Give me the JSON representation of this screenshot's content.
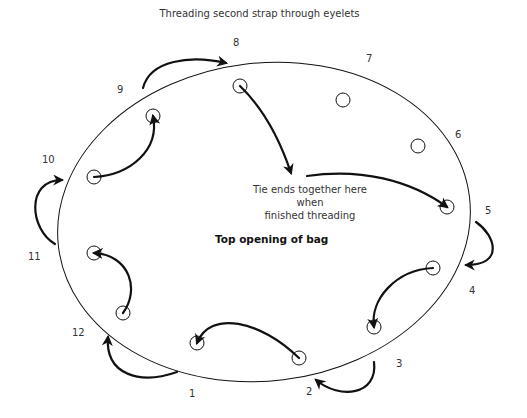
{
  "title": "Threading second strap through eyelets",
  "center_label": "Top opening of bag",
  "note": {
    "line1": "Tie ends together here when",
    "line2": "finished threading"
  },
  "eyelet_numbers": [
    {
      "n": "1",
      "x": 189,
      "y": 389
    },
    {
      "n": "2",
      "x": 306,
      "y": 387
    },
    {
      "n": "3",
      "x": 396,
      "y": 359
    },
    {
      "n": "4",
      "x": 469,
      "y": 286
    },
    {
      "n": "5",
      "x": 485,
      "y": 206
    },
    {
      "n": "6",
      "x": 455,
      "y": 130
    },
    {
      "n": "7",
      "x": 366,
      "y": 54
    },
    {
      "n": "8",
      "x": 233,
      "y": 38
    },
    {
      "n": "9",
      "x": 117,
      "y": 85
    },
    {
      "n": "10",
      "x": 42,
      "y": 155
    },
    {
      "n": "11",
      "x": 28,
      "y": 252
    },
    {
      "n": "12",
      "x": 72,
      "y": 328
    }
  ],
  "colors": {
    "stroke": "#111111",
    "text": "#333333",
    "background": "#ffffff"
  }
}
